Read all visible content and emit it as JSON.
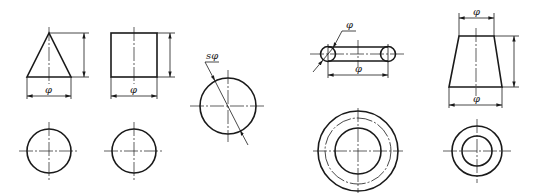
{
  "figure": {
    "type": "engineering dimensioning diagram of basic solids",
    "colors": {
      "ink": "#1a1a1a",
      "background": "#ffffff"
    }
  },
  "views": [
    {
      "id": "cone",
      "shape": "cone",
      "front_view": "triangle",
      "top_view": "circle with centerlines",
      "dimensions": [
        {
          "kind": "height",
          "label": ""
        },
        {
          "kind": "diameter",
          "label": "φ"
        }
      ]
    },
    {
      "id": "cylinder",
      "shape": "cylinder",
      "front_view": "rectangle",
      "top_view": "circle with centerlines",
      "dimensions": [
        {
          "kind": "height",
          "label": ""
        },
        {
          "kind": "diameter",
          "label": "φ"
        }
      ]
    },
    {
      "id": "sphere",
      "shape": "sphere",
      "front_view": "circle",
      "top_view": "",
      "dimensions": [
        {
          "kind": "spherical-diameter",
          "label": "sφ"
        }
      ]
    },
    {
      "id": "torus",
      "shape": "torus",
      "front_view": "ring section",
      "top_view": "concentric circles",
      "dimensions": [
        {
          "kind": "tube-diameter",
          "label": "φ"
        },
        {
          "kind": "center-diameter",
          "label": "φ"
        }
      ]
    },
    {
      "id": "frustum",
      "shape": "truncated cone",
      "front_view": "trapezoid",
      "top_view": "concentric circles",
      "dimensions": [
        {
          "kind": "top-diameter",
          "label": "φ"
        },
        {
          "kind": "height",
          "label": ""
        },
        {
          "kind": "bottom-diameter",
          "label": "φ"
        }
      ]
    }
  ],
  "labels": {
    "cone_dia": "φ",
    "cylinder_dia": "φ",
    "sphere_dia": "sφ",
    "torus_tube_dia": "φ",
    "torus_center_dia": "φ",
    "frustum_top_dia": "φ",
    "frustum_bottom_dia": "φ"
  }
}
